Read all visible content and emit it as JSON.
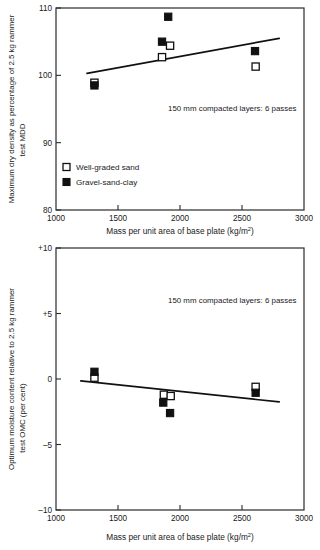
{
  "chart_data": [
    {
      "id": "upper",
      "type": "scatter",
      "title": "",
      "xlabel": "Mass per unit area of base plate (kg/m²)",
      "xlabel_base": "Mass per unit area of base plate (kg/m",
      "xlabel_sup": "2",
      "xlabel_tail": ")",
      "ylabel_line1": "Maximum dry density as percentage of 2.5 kg rammer",
      "ylabel_line2": "test MDD",
      "xlim": [
        1000,
        3000
      ],
      "ylim": [
        80,
        110
      ],
      "xticks": [
        1000,
        1500,
        2000,
        2500,
        3000
      ],
      "xtick_labels": [
        "1000",
        "1500",
        "2000",
        "2500",
        "3000"
      ],
      "yticks": [
        80,
        90,
        100,
        110
      ],
      "ytick_labels": [
        "80",
        "90",
        "100",
        "110"
      ],
      "grid": false,
      "annotation": "150 mm compacted layers: 6 passes",
      "legend_position": "lower-left",
      "legend": [
        {
          "label": "Well-graded sand",
          "marker": "open-square"
        },
        {
          "label": "Gravel-sand-clay",
          "marker": "filled-square"
        }
      ],
      "series": [
        {
          "name": "Well-graded sand",
          "marker": "open-square",
          "points": [
            {
              "x": 1310,
              "y": 98.9
            },
            {
              "x": 1855,
              "y": 102.7
            },
            {
              "x": 1920,
              "y": 104.4
            },
            {
              "x": 2610,
              "y": 101.3
            }
          ]
        },
        {
          "name": "Gravel-sand-clay",
          "marker": "filled-square",
          "points": [
            {
              "x": 1310,
              "y": 98.5
            },
            {
              "x": 1855,
              "y": 105.0
            },
            {
              "x": 1905,
              "y": 108.7
            },
            {
              "x": 2605,
              "y": 103.6
            }
          ]
        }
      ],
      "trendline": {
        "x1": 1250,
        "y1": 100.3,
        "x2": 2800,
        "y2": 105.5
      }
    },
    {
      "id": "lower",
      "type": "scatter",
      "title": "",
      "xlabel": "Mass per unit area of base plate (kg/m²)",
      "xlabel_base": "Mass per unit area of base plate (kg/m",
      "xlabel_sup": "2",
      "xlabel_tail": ")",
      "ylabel_line1": "Optimum moisture content relative to 2.5 kg rammer",
      "ylabel_line2": "test OMC (per cent)",
      "xlim": [
        1000,
        3000
      ],
      "ylim": [
        -10,
        10
      ],
      "xticks": [
        1000,
        1500,
        2000,
        2500,
        3000
      ],
      "xtick_labels": [
        "1000",
        "1500",
        "2000",
        "2500",
        "3000"
      ],
      "yticks": [
        -10,
        -5,
        0,
        5,
        10
      ],
      "ytick_labels": [
        "–10",
        "–5",
        "0",
        "+5",
        "+10"
      ],
      "grid": false,
      "annotation": "150 mm compacted layers: 6 passes",
      "legend_position": "none",
      "legend": [],
      "series": [
        {
          "name": "Well-graded sand",
          "marker": "open-square",
          "points": [
            {
              "x": 1310,
              "y": 0.1
            },
            {
              "x": 1870,
              "y": -1.2
            },
            {
              "x": 1925,
              "y": -1.3
            },
            {
              "x": 2610,
              "y": -0.6
            }
          ]
        },
        {
          "name": "Gravel-sand-clay",
          "marker": "filled-square",
          "points": [
            {
              "x": 1310,
              "y": 0.55
            },
            {
              "x": 1865,
              "y": -1.8
            },
            {
              "x": 1920,
              "y": -2.6
            },
            {
              "x": 2610,
              "y": -1.05
            }
          ]
        }
      ],
      "trendline": {
        "x1": 1200,
        "y1": -0.15,
        "x2": 2800,
        "y2": -1.75
      }
    }
  ]
}
